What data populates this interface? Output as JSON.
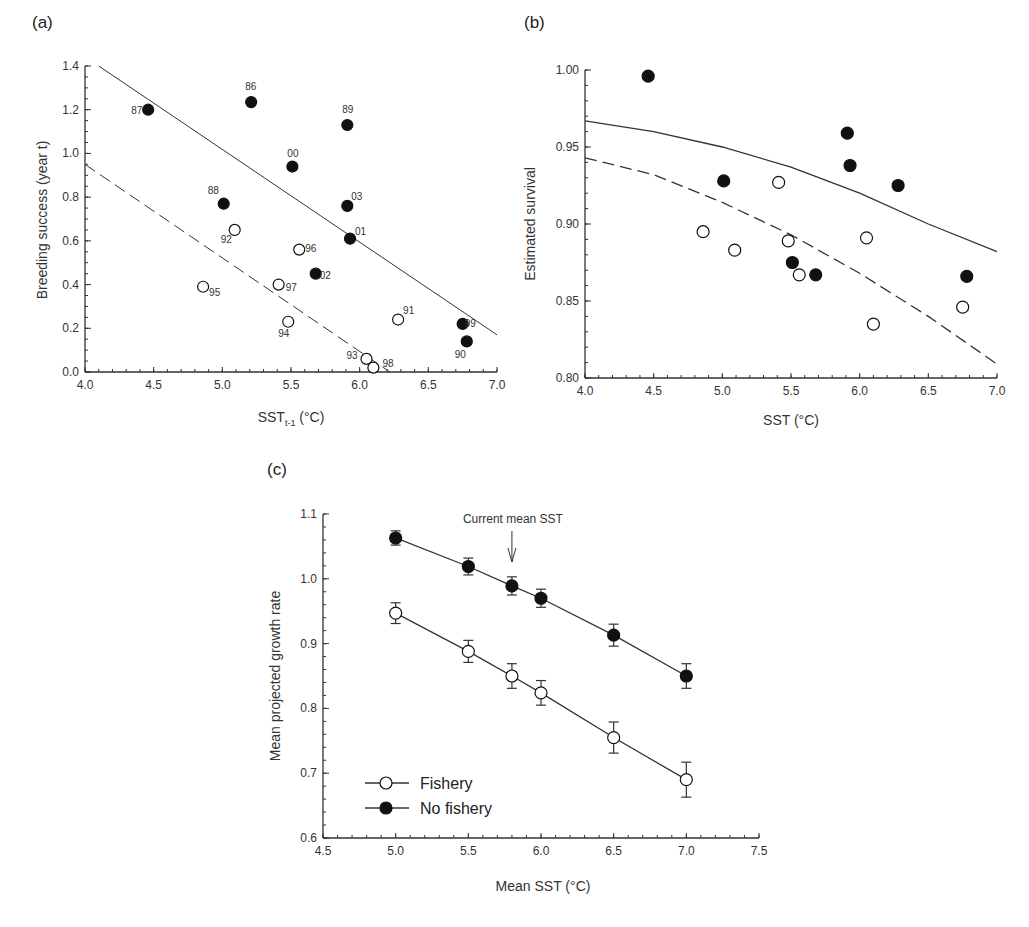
{
  "panels": {
    "a": {
      "label": "(a)"
    },
    "b": {
      "label": "(b)"
    },
    "c": {
      "label": "(c)"
    }
  },
  "chart_data": [
    {
      "id": "a",
      "type": "scatter",
      "title": "(a)",
      "xlabel": "SST t-1 (°C)",
      "xlabel_main": "SST",
      "xlabel_sub": "t-1",
      "xlabel_unit": " (°C)",
      "ylabel": "Breeding success (year t)",
      "xlim": [
        4.0,
        7.0
      ],
      "ylim": [
        0.0,
        1.4
      ],
      "xticks": [
        "4.0",
        "4.5",
        "5.0",
        "5.5",
        "6.0",
        "6.5",
        "7.0"
      ],
      "yticks": [
        "0.0",
        "0.2",
        "0.4",
        "0.6",
        "0.8",
        "1.0",
        "1.2",
        "1.4"
      ],
      "grid": false,
      "series": [
        {
          "name": "No fishery (filled)",
          "marker": "filled",
          "points": [
            {
              "label": "87",
              "x": 4.46,
              "y": 1.2
            },
            {
              "label": "86",
              "x": 5.21,
              "y": 1.235
            },
            {
              "label": "89",
              "x": 5.91,
              "y": 1.13
            },
            {
              "label": "00",
              "x": 5.51,
              "y": 0.94
            },
            {
              "label": "88",
              "x": 5.01,
              "y": 0.77
            },
            {
              "label": "03",
              "x": 5.91,
              "y": 0.76
            },
            {
              "label": "01",
              "x": 5.93,
              "y": 0.61
            },
            {
              "label": "02",
              "x": 5.68,
              "y": 0.45
            },
            {
              "label": "99",
              "x": 6.75,
              "y": 0.22
            },
            {
              "label": "90",
              "x": 6.78,
              "y": 0.14
            }
          ]
        },
        {
          "name": "Fishery (open)",
          "marker": "open",
          "points": [
            {
              "label": "92",
              "x": 5.09,
              "y": 0.65
            },
            {
              "label": "96",
              "x": 5.56,
              "y": 0.56
            },
            {
              "label": "95",
              "x": 4.86,
              "y": 0.39
            },
            {
              "label": "97",
              "x": 5.41,
              "y": 0.4
            },
            {
              "label": "94",
              "x": 5.48,
              "y": 0.23
            },
            {
              "label": "91",
              "x": 6.28,
              "y": 0.24
            },
            {
              "label": "93",
              "x": 6.05,
              "y": 0.06
            },
            {
              "label": "98",
              "x": 6.1,
              "y": 0.02
            }
          ]
        }
      ],
      "fit_lines": [
        {
          "name": "No fishery fit",
          "style": "solid",
          "x": [
            4.1,
            7.0
          ],
          "y": [
            1.4,
            0.17
          ]
        },
        {
          "name": "Fishery fit",
          "style": "dashed",
          "x": [
            4.0,
            6.22
          ],
          "y": [
            0.95,
            0.0
          ]
        }
      ]
    },
    {
      "id": "b",
      "type": "scatter",
      "title": "(b)",
      "xlabel": "SST (°C)",
      "ylabel": "Estimated survival",
      "xlim": [
        4.0,
        7.0
      ],
      "ylim": [
        0.8,
        1.0
      ],
      "xticks": [
        "4.0",
        "4.5",
        "5.0",
        "5.5",
        "6.0",
        "6.5",
        "7.0"
      ],
      "yticks": [
        "0.80",
        "0.85",
        "0.90",
        "0.95",
        "1.00"
      ],
      "grid": false,
      "series": [
        {
          "name": "No fishery (filled)",
          "marker": "filled",
          "points": [
            {
              "x": 4.46,
              "y": 0.996
            },
            {
              "x": 5.01,
              "y": 0.928
            },
            {
              "x": 5.91,
              "y": 0.959
            },
            {
              "x": 5.93,
              "y": 0.938
            },
            {
              "x": 6.28,
              "y": 0.925
            },
            {
              "x": 5.51,
              "y": 0.875
            },
            {
              "x": 5.68,
              "y": 0.867
            },
            {
              "x": 6.78,
              "y": 0.866
            }
          ]
        },
        {
          "name": "Fishery (open)",
          "marker": "open",
          "points": [
            {
              "x": 5.41,
              "y": 0.927
            },
            {
              "x": 4.86,
              "y": 0.895
            },
            {
              "x": 5.09,
              "y": 0.883
            },
            {
              "x": 5.48,
              "y": 0.889
            },
            {
              "x": 5.56,
              "y": 0.867
            },
            {
              "x": 6.05,
              "y": 0.891
            },
            {
              "x": 6.1,
              "y": 0.835
            },
            {
              "x": 6.75,
              "y": 0.846
            }
          ]
        }
      ],
      "fit_lines": [
        {
          "name": "No fishery fit",
          "style": "solid",
          "x": [
            4.0,
            4.5,
            5.0,
            5.5,
            6.0,
            6.5,
            7.0
          ],
          "y": [
            0.967,
            0.96,
            0.95,
            0.937,
            0.92,
            0.9,
            0.882
          ]
        },
        {
          "name": "Fishery fit",
          "style": "dashed",
          "x": [
            4.0,
            4.5,
            5.0,
            5.5,
            6.0,
            6.5,
            7.0
          ],
          "y": [
            0.943,
            0.932,
            0.914,
            0.893,
            0.868,
            0.84,
            0.809
          ]
        }
      ]
    },
    {
      "id": "c",
      "type": "line",
      "title": "(c)",
      "xlabel": "Mean SST (°C)",
      "ylabel": "Mean projected growth rate",
      "xlim": [
        4.5,
        7.5
      ],
      "ylim": [
        0.6,
        1.1
      ],
      "xticks": [
        "4.5",
        "5.0",
        "5.5",
        "6.0",
        "6.5",
        "7.0",
        "7.5"
      ],
      "yticks": [
        "0.6",
        "0.7",
        "0.8",
        "0.9",
        "1.0",
        "1.1"
      ],
      "grid": false,
      "legend_position": "lower left",
      "annotation": {
        "text": "Current mean SST",
        "x": 5.8
      },
      "x": [
        5.0,
        5.5,
        5.8,
        6.0,
        6.5,
        7.0
      ],
      "series": [
        {
          "name": "Fishery",
          "marker": "open",
          "values": [
            0.947,
            0.888,
            0.85,
            0.824,
            0.755,
            0.69
          ],
          "err": [
            0.016,
            0.017,
            0.019,
            0.019,
            0.024,
            0.027
          ]
        },
        {
          "name": "No fishery",
          "marker": "filled",
          "values": [
            1.063,
            1.019,
            0.989,
            0.97,
            0.913,
            0.85
          ],
          "err": [
            0.011,
            0.013,
            0.014,
            0.014,
            0.017,
            0.019
          ]
        }
      ]
    }
  ]
}
